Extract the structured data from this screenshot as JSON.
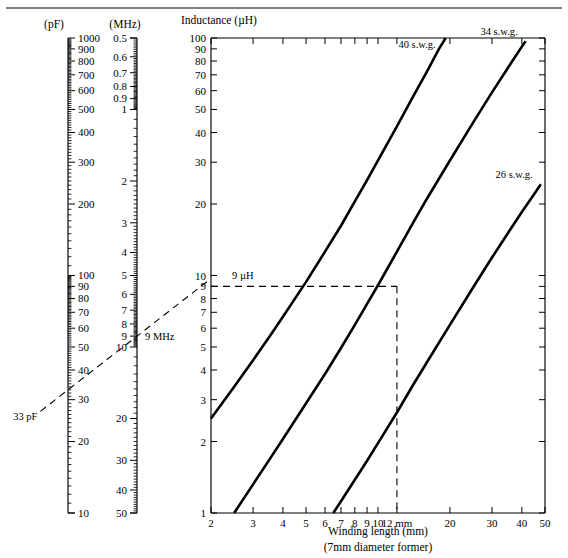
{
  "figure": {
    "top_rule": true,
    "background_color": "#ffffff",
    "ink_color": "#000000"
  },
  "capacitance_scale": {
    "header": "(pF)",
    "unit": "pF",
    "orientation": "vertical",
    "scale_type": "log",
    "top_value": 1000,
    "bottom_value": 10,
    "direction": "descending",
    "labels": [
      "1000",
      "900",
      "800",
      "700",
      "600",
      "500",
      "400",
      "300",
      "200",
      "100",
      "90",
      "80",
      "70",
      "60",
      "50",
      "40",
      "30",
      "20",
      "10"
    ],
    "label_values": [
      1000,
      900,
      800,
      700,
      600,
      500,
      400,
      300,
      200,
      100,
      90,
      80,
      70,
      60,
      50,
      40,
      30,
      20,
      10
    ]
  },
  "frequency_scale": {
    "header": "(MHz)",
    "unit": "MHz",
    "orientation": "vertical",
    "scale_type": "log",
    "top_value": 0.5,
    "bottom_value": 50,
    "direction": "ascending",
    "labels": [
      "0.5",
      "0.6",
      "0.7",
      "0.8",
      "0.9",
      "1",
      "2",
      "3",
      "4",
      "5",
      "6",
      "7",
      "8",
      "9",
      "10",
      "20",
      "30",
      "40",
      "50"
    ],
    "label_values": [
      0.5,
      0.6,
      0.7,
      0.8,
      0.9,
      1,
      2,
      3,
      4,
      5,
      6,
      7,
      8,
      9,
      10,
      20,
      30,
      40,
      50
    ]
  },
  "annotations": {
    "capacitance_marker": "33 pF",
    "capacitance_marker_value": 33,
    "frequency_marker": "9 MHz",
    "frequency_marker_value": 9,
    "inductance_marker": "9 µH",
    "inductance_marker_value": 9,
    "winding_length_marker": "12 mm",
    "winding_length_marker_value": 12
  },
  "chart_data": {
    "type": "line",
    "title": "",
    "ylabel": "Inductance (µH)",
    "xlabel": "Winding length (mm)",
    "xlabel_sub": "(7mm diameter former)",
    "xscale": "log",
    "yscale": "log",
    "xlim": [
      2,
      50
    ],
    "ylim": [
      1,
      100
    ],
    "grid": false,
    "legend": "inline-curve-labels",
    "x_ticks": [
      2,
      3,
      4,
      5,
      6,
      7,
      8,
      9,
      10,
      12,
      20,
      30,
      40,
      50
    ],
    "x_tick_labels": [
      "2",
      "3",
      "4",
      "5",
      "6",
      "7",
      "8",
      "9",
      "10",
      "12 mm",
      "20",
      "30",
      "40",
      "50"
    ],
    "y_ticks": [
      1,
      2,
      3,
      4,
      5,
      6,
      7,
      8,
      9,
      10,
      20,
      30,
      40,
      50,
      60,
      70,
      80,
      90,
      100
    ],
    "y_tick_labels": [
      "1",
      "2",
      "3",
      "4",
      "5",
      "6",
      "7",
      "8",
      "9",
      "10",
      "20",
      "30",
      "40",
      "50",
      "60",
      "70",
      "80",
      "90",
      "100"
    ],
    "series": [
      {
        "name": "40 s.w.g.",
        "label": "40 s.w.g.",
        "points": [
          [
            2.0,
            2.5
          ],
          [
            2.5,
            3.4
          ],
          [
            3.0,
            4.4
          ],
          [
            3.5,
            5.5
          ],
          [
            4.0,
            6.7
          ],
          [
            5.0,
            9.4
          ],
          [
            6.0,
            12.6
          ],
          [
            7.0,
            16.2
          ],
          [
            8.0,
            20.5
          ],
          [
            9.0,
            25.2
          ],
          [
            10.0,
            30.5
          ],
          [
            12.0,
            42.5
          ],
          [
            14.0,
            56.5
          ],
          [
            16.0,
            72.0
          ],
          [
            18.0,
            90.0
          ],
          [
            19.2,
            100.0
          ]
        ]
      },
      {
        "name": "34 s.w.g.",
        "label": "34 s.w.g.",
        "points": [
          [
            2.5,
            1.0
          ],
          [
            3.0,
            1.32
          ],
          [
            3.5,
            1.67
          ],
          [
            4.0,
            2.05
          ],
          [
            5.0,
            2.9
          ],
          [
            6.0,
            3.85
          ],
          [
            7.0,
            4.95
          ],
          [
            8.0,
            6.2
          ],
          [
            9.0,
            7.6
          ],
          [
            10.0,
            9.1
          ],
          [
            12.0,
            12.6
          ],
          [
            14.0,
            16.6
          ],
          [
            16.0,
            21.0
          ],
          [
            20.0,
            30.5
          ],
          [
            25.0,
            44.0
          ],
          [
            30.0,
            59.0
          ],
          [
            35.0,
            75.0
          ],
          [
            40.0,
            92.0
          ],
          [
            41.5,
            97.0
          ]
        ]
      },
      {
        "name": "26 s.w.g.",
        "label": "26 s.w.g.",
        "points": [
          [
            6.5,
            1.0
          ],
          [
            7.0,
            1.12
          ],
          [
            8.0,
            1.38
          ],
          [
            9.0,
            1.66
          ],
          [
            10.0,
            1.97
          ],
          [
            12.0,
            2.65
          ],
          [
            14.0,
            3.45
          ],
          [
            16.0,
            4.3
          ],
          [
            20.0,
            6.2
          ],
          [
            25.0,
            8.9
          ],
          [
            30.0,
            11.9
          ],
          [
            35.0,
            15.1
          ],
          [
            40.0,
            18.5
          ],
          [
            45.0,
            22.0
          ],
          [
            48.0,
            24.2
          ]
        ]
      }
    ],
    "construction_lines": [
      {
        "name": "inductance-horizontal",
        "from": [
          2,
          9
        ],
        "to": [
          12,
          9
        ],
        "style": "dashed"
      },
      {
        "name": "winding-length-vertical",
        "from": [
          12,
          9
        ],
        "to": [
          12,
          1
        ],
        "style": "dashed"
      }
    ]
  },
  "nomogram_line": {
    "name": "capacitance-frequency-tie-line",
    "style": "dashed",
    "from_label": "33 pF",
    "to_label": "9 MHz",
    "extends_to": "9 µH"
  }
}
